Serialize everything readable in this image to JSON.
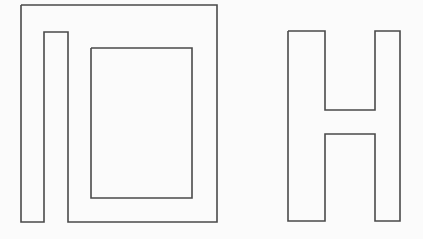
{
  "canvas": {
    "width": 423,
    "height": 239,
    "background_color": "#fbfbfb",
    "stroke_color": "#4a4a4a",
    "stroke_width": 1.6,
    "description": "Two black outline line-drawings on a plain off-white background"
  },
  "figures": [
    {
      "id": "spiral-figure",
      "name": "nested-rectangular-spiral",
      "description": "Left figure: an inward rectangular spiral formed by three nested open rings, open at the bottom",
      "bounds": {
        "x": 21,
        "y": 5,
        "width": 196,
        "height": 217
      },
      "outline_points": "21,5 217,5 217,222 68,222 68,32 44,32 44,222 21,222 21,5",
      "inner_points": "91,48 192,48 192,198 91,198 91,48",
      "stroke_color": "#4a4a4a"
    },
    {
      "id": "letter-h-figure",
      "name": "letter-h-outline",
      "description": "Right figure: the capital letter H drawn as a single closed outline",
      "bounds": {
        "x": 288,
        "y": 31,
        "width": 112,
        "height": 190
      },
      "outline_points": "288,31 325,31 325,110 375,110 375,31 400,31 400,221 375,221 375,134 325,134 325,221 288,221 288,31",
      "stroke_color": "#4a4a4a"
    }
  ]
}
